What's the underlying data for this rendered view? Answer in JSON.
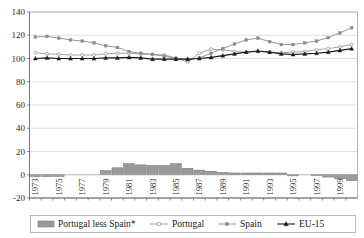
{
  "chart_data": {
    "type": "line",
    "title": "",
    "subtitle": "",
    "xlabel": "",
    "ylabel": "",
    "ylim": [
      -20,
      140
    ],
    "ytick_values": [
      -20,
      0,
      20,
      40,
      60,
      80,
      100,
      120,
      140
    ],
    "ytick_labels": [
      "-20",
      "0",
      "20",
      "40",
      "60",
      "80",
      "100",
      "120",
      "140"
    ],
    "grid": true,
    "legend_position": "bottom",
    "x": [
      1973,
      1974,
      1975,
      1976,
      1977,
      1978,
      1979,
      1980,
      1981,
      1982,
      1983,
      1984,
      1985,
      1986,
      1987,
      1988,
      1989,
      1990,
      1991,
      1992,
      1993,
      1994,
      1995,
      1996,
      1997,
      1998,
      1999,
      2000
    ],
    "xtick_labels": [
      "1973",
      "1975",
      "1977",
      "1979",
      "1981",
      "1983",
      "1985",
      "1987",
      "1989",
      "1991",
      "1993",
      "1995",
      "1997",
      "1999"
    ],
    "xtick_values": [
      1973,
      1975,
      1977,
      1979,
      1981,
      1983,
      1985,
      1987,
      1989,
      1991,
      1993,
      1995,
      1997,
      1999
    ],
    "series": [
      {
        "name": "Portugal less Spain*",
        "type": "bar",
        "color": "#9a9a9a",
        "edge_color": "#6e6e6e",
        "values": [
          -1.5,
          -1.5,
          -1.5,
          0,
          0,
          0,
          3.5,
          6,
          9.5,
          8.5,
          8,
          8,
          9.5,
          5.5,
          4,
          3,
          2,
          1.5,
          1.5,
          1.5,
          1.5,
          1.5,
          -1,
          0,
          -0.5,
          -2,
          -3.5,
          -5
        ]
      },
      {
        "name": "Portugal",
        "type": "line",
        "color": "#9a9a9a",
        "marker": "circle-open",
        "values": [
          105,
          104,
          103.5,
          103,
          103,
          103,
          104,
          104.5,
          104.5,
          104,
          103.5,
          103,
          100.5,
          97,
          104.5,
          108,
          107.5,
          106,
          105.5,
          106,
          105.5,
          105,
          105.5,
          106,
          107.5,
          108.5,
          110,
          112
        ]
      },
      {
        "name": "Spain",
        "type": "line",
        "color": "#8c8c8c",
        "marker": "dot",
        "values": [
          118.5,
          119,
          117.5,
          116,
          115,
          113.5,
          111,
          109.5,
          106,
          104.5,
          103.5,
          102,
          100,
          99,
          100.5,
          104.5,
          108.5,
          112.5,
          116,
          117.5,
          114.5,
          112,
          112,
          113.5,
          115,
          118,
          122,
          126.5
        ]
      },
      {
        "name": "EU-15",
        "type": "line",
        "color": "#1a1a1a",
        "marker": "triangle",
        "values": [
          100,
          100.5,
          100,
          100,
          100,
          100,
          100.5,
          100.5,
          101,
          100.5,
          99.5,
          99.5,
          99.5,
          99.5,
          100,
          101,
          102.5,
          104,
          105.5,
          106.5,
          105.5,
          104,
          103.5,
          104,
          104.5,
          105.5,
          107,
          108.5
        ]
      }
    ]
  },
  "legend": {
    "items": [
      {
        "label": "Portugal less Spain*",
        "glyph": "bar-swatch"
      },
      {
        "label": "Portugal",
        "glyph": "line-circle-open-marker"
      },
      {
        "label": "Spain",
        "glyph": "line-dot-marker"
      },
      {
        "label": "EU-15",
        "glyph": "line-triangle-marker"
      }
    ]
  }
}
